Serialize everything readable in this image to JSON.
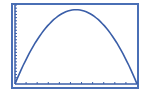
{
  "chart_data": {
    "type": "line",
    "title": "",
    "xlabel": "",
    "ylabel": "",
    "x": [
      0,
      1,
      2,
      3,
      4,
      5,
      6,
      7,
      8,
      9,
      10,
      11
    ],
    "series": [
      {
        "name": "y",
        "values": [
          0,
          3.3,
          6.1,
          8.3,
          9.7,
          10.0,
          10.0,
          9.7,
          8.3,
          6.1,
          3.3,
          0
        ]
      }
    ],
    "xlim": [
      0,
      11
    ],
    "ylim": [
      0,
      10.5
    ],
    "x_ticks": 11,
    "y_ticks": 25,
    "grid": false,
    "legend": "none"
  },
  "colors": {
    "frame": "#4a6fb5",
    "curve": "#3a5ea8",
    "axis": "#3a5ea8",
    "background": "#ffffff"
  }
}
